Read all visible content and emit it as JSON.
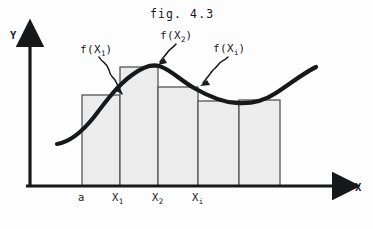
{
  "figure": {
    "title": "fig. 4.3",
    "type": "riemann-sum-diagram",
    "axes": {
      "y_label": "Y",
      "x_label": "X",
      "origin": {
        "x": 30,
        "y": 186
      },
      "y_axis_top": {
        "x": 30,
        "y": 36
      },
      "x_axis_right": {
        "x": 345,
        "y": 186
      }
    },
    "colors": {
      "ink": "#17181a",
      "bar_fill": "#ececec",
      "bar_stroke": "#555555",
      "background": "#fdfdfd"
    },
    "callouts": [
      {
        "name": "f-x1",
        "text_main": "f(X",
        "text_sub": "1",
        "text_close": ")",
        "label_x": 80,
        "label_y": 44,
        "arrow_path": "M 99 57 C 103 64, 107 62, 109 70 C 110 76, 112 76, 115 80 L 122 94",
        "arrow_tip": "M 122 94 L 114 90 L 118 84 Z"
      },
      {
        "name": "f-x2",
        "text_main": "f(X",
        "text_sub": "2",
        "text_close": ")",
        "label_x": 160,
        "label_y": 30,
        "arrow_path": "M 176 44 C 172 49, 170 48, 167 53 C 164 57, 163 57, 160 62",
        "arrow_tip": "M 158 65 L 164 58 L 167 63 Z"
      },
      {
        "name": "f-xi",
        "text_main": "f(X",
        "text_sub": "i",
        "text_close": ")",
        "label_x": 213,
        "label_y": 43,
        "arrow_path": "M 228 57 C 223 62, 221 60, 218 65 C 214 70, 214 68, 210 74 L 203 83",
        "arrow_tip": "M 200 86 L 207 80 L 210 85 Z"
      }
    ],
    "curve": {
      "path": "M 57 144 C 70 142, 82 132, 94 117 C 106 101, 118 85, 132 75 C 143 67, 152 64, 159 66 C 170 69, 180 80, 194 88 C 208 96, 222 102, 236 103 C 250 104, 264 101, 276 93 C 290 84, 302 74, 316 67",
      "stroke_width": 4.2
    },
    "bars": [
      {
        "name": "bar-1",
        "x": 82,
        "width": 38,
        "top": 95,
        "height": 91
      },
      {
        "name": "bar-2",
        "x": 120,
        "width": 38,
        "top": 67,
        "height": 119
      },
      {
        "name": "bar-3",
        "x": 158,
        "width": 40,
        "top": 87,
        "height": 99
      },
      {
        "name": "bar-4",
        "x": 198,
        "width": 41,
        "top": 101,
        "height": 85
      },
      {
        "name": "bar-5",
        "x": 239,
        "width": 41,
        "top": 100,
        "height": 86
      }
    ],
    "x_ticks": [
      {
        "name": "tick-a",
        "text_main": "a",
        "text_sub": "",
        "x": 78,
        "y": 192
      },
      {
        "name": "tick-x1",
        "text_main": "X",
        "text_sub": "1",
        "x": 112,
        "y": 192
      },
      {
        "name": "tick-x2",
        "text_main": "X",
        "text_sub": "2",
        "x": 152,
        "y": 192
      },
      {
        "name": "tick-xi",
        "text_main": "X",
        "text_sub": "i",
        "x": 192,
        "y": 192
      }
    ]
  }
}
